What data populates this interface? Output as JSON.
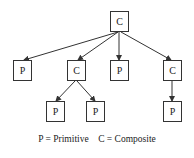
{
  "diagram": {
    "type": "tree",
    "nodes": [
      {
        "id": "root",
        "label": "C"
      },
      {
        "id": "n1",
        "label": "P"
      },
      {
        "id": "n2",
        "label": "C"
      },
      {
        "id": "n3",
        "label": "P"
      },
      {
        "id": "n4",
        "label": "C"
      },
      {
        "id": "n5",
        "label": "P"
      },
      {
        "id": "n6",
        "label": "P"
      },
      {
        "id": "n7",
        "label": "P"
      }
    ],
    "edges": [
      [
        "root",
        "n1"
      ],
      [
        "root",
        "n2"
      ],
      [
        "root",
        "n3"
      ],
      [
        "root",
        "n4"
      ],
      [
        "n2",
        "n5"
      ],
      [
        "n2",
        "n6"
      ],
      [
        "n4",
        "n7"
      ]
    ],
    "legend": "P = Primitive    C = Composite"
  }
}
